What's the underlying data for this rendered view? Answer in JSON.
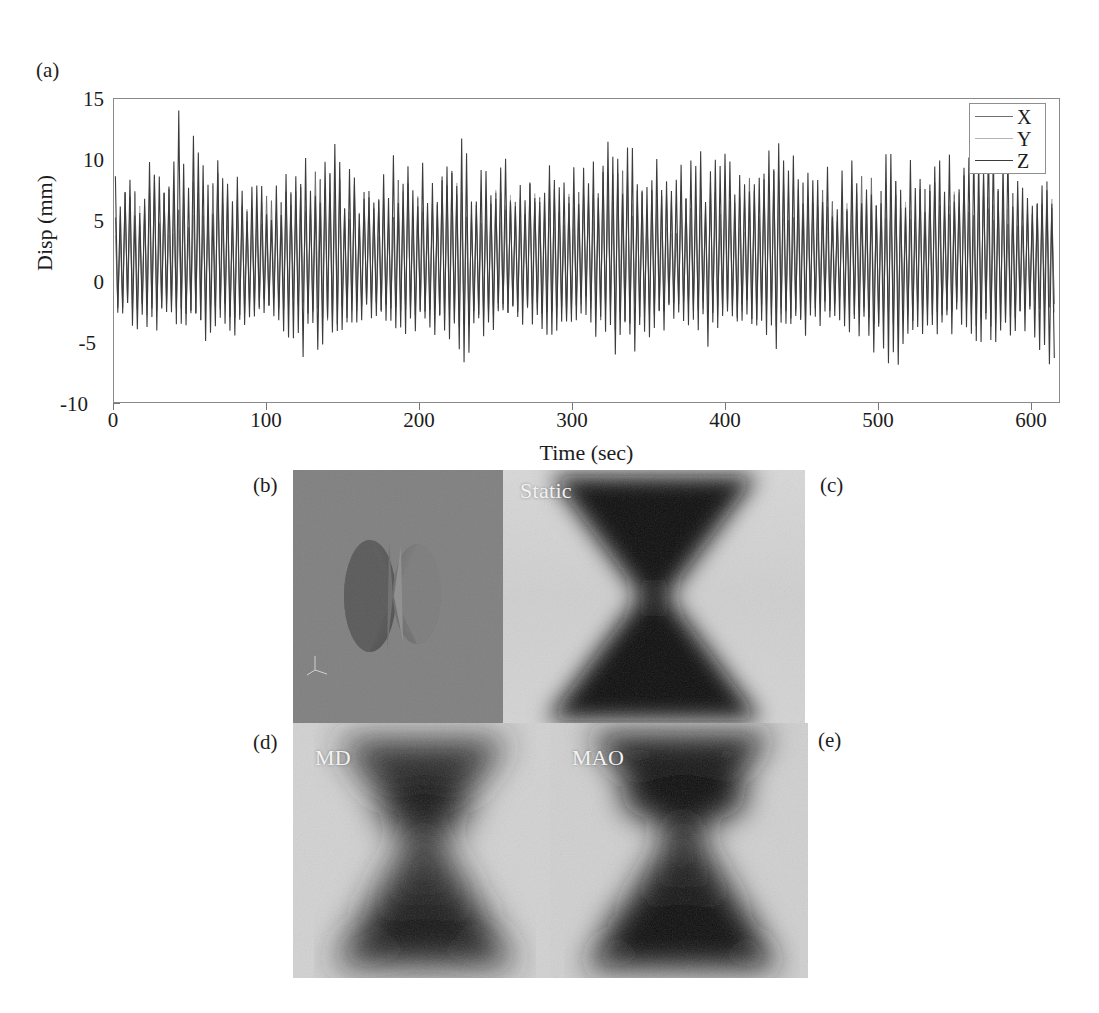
{
  "figure": {
    "panels": [
      {
        "tag": "(a)",
        "type": "timeseries-plot"
      },
      {
        "tag": "(b)",
        "type": "3d-render",
        "description": "double-cone"
      },
      {
        "tag": "(c)",
        "type": "grayscale-field",
        "caption": "Static"
      },
      {
        "tag": "(d)",
        "type": "grayscale-field",
        "caption": "MD"
      },
      {
        "tag": "(e)",
        "type": "grayscale-field",
        "caption": "MAO"
      }
    ]
  },
  "panel_a": {
    "label": "(a)",
    "legend": {
      "position": "top-right",
      "entries": [
        {
          "name": "X",
          "color": "#6e6e6e"
        },
        {
          "name": "Y",
          "color": "#b4b4b4"
        },
        {
          "name": "Z",
          "color": "#3c3c3c"
        }
      ]
    }
  },
  "panel_b": {
    "label": "(b)",
    "background_color": "#7f7f7f",
    "axis_triad_color": "#e8e8e8"
  },
  "panel_c": {
    "label": "(c)",
    "caption": "Static"
  },
  "panel_d": {
    "label": "(d)",
    "caption": "MD"
  },
  "panel_e": {
    "label": "(e)",
    "caption": "MAO"
  },
  "chart_data": {
    "type": "line",
    "title": "",
    "xlabel": "Time (sec)",
    "ylabel": "Disp (mm)",
    "xlim": [
      0,
      620
    ],
    "ylim": [
      -10,
      15
    ],
    "xticks": [
      0,
      100,
      200,
      300,
      400,
      500,
      600
    ],
    "xticklabels": [
      "0",
      "100",
      "200",
      "300",
      "400",
      "500",
      "600"
    ],
    "yticks": [
      -10,
      -5,
      0,
      5,
      10,
      15
    ],
    "yticklabels": [
      "-10",
      "-5",
      "0",
      "5",
      "10",
      "15"
    ],
    "grid": false,
    "legend_position": "upper right",
    "series": [
      {
        "name": "X",
        "color": "#6e6e6e",
        "envelope_max": [
          6.5,
          8.8,
          7.2,
          9.0,
          7.5,
          6.9,
          8.2,
          9.5,
          7.0,
          8.0,
          7.4,
          9.2,
          8.1,
          7.6,
          8.8,
          7.2,
          9.4,
          8.0,
          7.1,
          8.6,
          7.8,
          9.0,
          8.3,
          7.0,
          8.5,
          9.1,
          7.7,
          8.2,
          9.3,
          7.4,
          8.0
        ],
        "envelope_min": [
          -2.6,
          -3.2,
          -2.4,
          -3.6,
          -2.8,
          -2.2,
          -3.0,
          -3.8,
          -2.5,
          -3.1,
          -2.7,
          -3.9,
          -3.3,
          -2.6,
          -3.5,
          -2.4,
          -4.0,
          -3.2,
          -2.3,
          -3.6,
          -2.9,
          -3.7,
          -3.1,
          -2.2,
          -3.4,
          -3.8,
          -2.8,
          -3.0,
          -4.1,
          -2.6,
          -3.0
        ],
        "mean": 1.2
      },
      {
        "name": "Y",
        "color": "#b4b4b4",
        "envelope_max": [
          5.8,
          7.9,
          6.4,
          8.1,
          6.8,
          6.2,
          7.4,
          8.6,
          6.3,
          7.2,
          6.7,
          8.3,
          7.3,
          6.9,
          7.9,
          6.5,
          8.5,
          7.2,
          6.4,
          7.7,
          7.0,
          8.1,
          7.5,
          6.3,
          7.6,
          8.2,
          6.9,
          7.4,
          8.4,
          6.7,
          7.2
        ],
        "envelope_min": [
          -2.2,
          -2.8,
          -2.0,
          -3.1,
          -2.4,
          -1.9,
          -2.6,
          -3.3,
          -2.1,
          -2.7,
          -2.3,
          -3.4,
          -2.9,
          -2.2,
          -3.0,
          -2.0,
          -3.5,
          -2.8,
          -2.0,
          -3.1,
          -2.5,
          -3.2,
          -2.7,
          -1.9,
          -2.9,
          -3.3,
          -2.4,
          -2.6,
          -3.6,
          -2.2,
          -2.6
        ],
        "mean": 1.0
      },
      {
        "name": "Z",
        "color": "#3c3c3c",
        "envelope_max": [
          8.8,
          9.4,
          14.2,
          10.1,
          9.6,
          8.9,
          10.4,
          11.2,
          9.1,
          10.0,
          9.5,
          11.5,
          10.3,
          9.8,
          11.0,
          9.3,
          11.6,
          10.2,
          9.2,
          10.8,
          10.0,
          11.3,
          10.5,
          9.1,
          10.7,
          11.4,
          9.9,
          10.4,
          11.5,
          9.6,
          10.2
        ],
        "envelope_min": [
          -3.4,
          -4.2,
          -3.6,
          -5.4,
          -4.0,
          -3.2,
          -6.4,
          -5.6,
          -3.5,
          -4.4,
          -3.8,
          -6.8,
          -5.2,
          -3.6,
          -5.0,
          -3.4,
          -7.0,
          -4.6,
          -3.3,
          -5.4,
          -4.2,
          -5.8,
          -4.8,
          -3.2,
          -5.2,
          -7.6,
          -4.2,
          -4.6,
          -6.2,
          -3.8,
          -7.8
        ],
        "mean": 1.3
      }
    ],
    "peak_positive": 14.2,
    "peak_negative": -7.8,
    "dominant_period_sec": 3.2
  }
}
